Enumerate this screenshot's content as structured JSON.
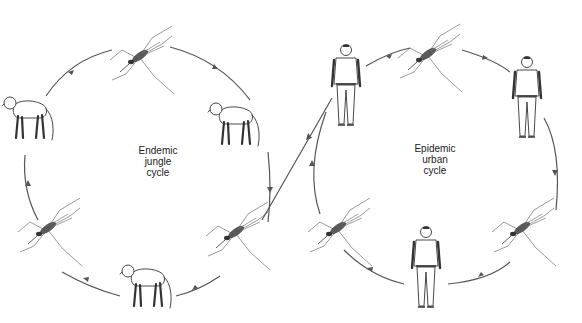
{
  "diagram": {
    "type": "transmission-cycle-illustration",
    "jungle_cycle": {
      "label_lines": [
        "Endemic",
        "jungle",
        "cycle"
      ],
      "hosts": [
        "monkey",
        "mosquito",
        "monkey",
        "mosquito",
        "monkey",
        "mosquito"
      ]
    },
    "urban_cycle": {
      "label_lines": [
        "Epidemic",
        "urban",
        "cycle"
      ],
      "hosts": [
        "human",
        "mosquito",
        "human",
        "mosquito",
        "human",
        "mosquito"
      ]
    },
    "link": "mosquito from jungle cycle carries infection to human in urban cycle",
    "colors": {
      "line": "#555555",
      "ink": "#333333",
      "background": "#ffffff"
    }
  }
}
